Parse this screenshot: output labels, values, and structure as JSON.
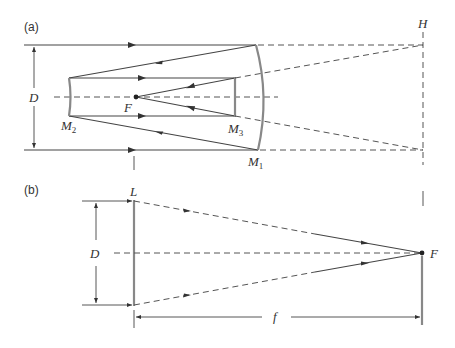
{
  "panels": {
    "a": {
      "label": "(a)",
      "aperture_label": "D",
      "focus_label": "F",
      "mirrors": {
        "primary": {
          "name": "M",
          "sub": "1"
        },
        "secondary": {
          "name": "M",
          "sub": "2"
        },
        "tertiary": {
          "name": "M",
          "sub": "3"
        }
      },
      "plane_label": "H"
    },
    "b": {
      "label": "(b)",
      "lens_label": "L",
      "aperture_label": "D",
      "focus_label": "F",
      "focal_length_label": "f"
    }
  },
  "colors": {
    "ray": "#444444",
    "mirror": "#888888",
    "dashed": "#555555"
  }
}
